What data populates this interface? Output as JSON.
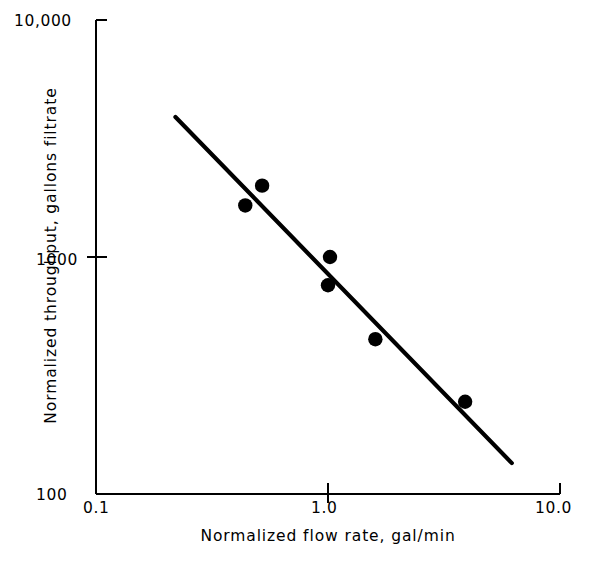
{
  "chart_data": {
    "type": "scatter",
    "title": "",
    "xlabel": "Normalized flow rate, gal/min",
    "ylabel": "Normalized throughput, gallons filtrate",
    "xscale": "log",
    "yscale": "log",
    "xlim": [
      0.1,
      10.0
    ],
    "ylim": [
      100,
      10000
    ],
    "grid": false,
    "legend": null,
    "xticks": [
      "0.1",
      "1.0",
      "10.0"
    ],
    "xtick_values": [
      0.1,
      1.0,
      10.0
    ],
    "yticks": [
      "100",
      "1000",
      "10,000"
    ],
    "ytick_values": [
      100,
      1000,
      10000
    ],
    "marker": "filled-circle",
    "marker_color": "#000000",
    "line_color": "#000000",
    "points": [
      {
        "x": 0.44,
        "y": 1650
      },
      {
        "x": 0.52,
        "y": 2000
      },
      {
        "x": 1.02,
        "y": 1000
      },
      {
        "x": 1.0,
        "y": 760
      },
      {
        "x": 1.6,
        "y": 450
      },
      {
        "x": 3.9,
        "y": 245
      }
    ],
    "series": [
      {
        "name": "trend line",
        "type": "line",
        "x": [
          0.22,
          6.2
        ],
        "y": [
          3900,
          135
        ]
      }
    ],
    "annotations": []
  },
  "axes": {
    "x_tick_0": "0.1",
    "x_tick_1": "1.0",
    "x_tick_2": "10.0",
    "y_tick_0": "100",
    "y_tick_1": "1000",
    "y_tick_2": "10,000",
    "x_title": "Normalized flow rate, gal/min",
    "y_title": "Normalized throughput, gallons filtrate"
  }
}
